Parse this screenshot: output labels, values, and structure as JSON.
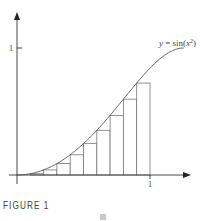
{
  "figure": {
    "caption": "FIGURE 1",
    "curve_label": "y = sin(x²)",
    "curve_label_parts": {
      "lhs": "y = sin(",
      "var": "x",
      "exp": "2",
      "close": ")"
    },
    "x_tick_label": "1",
    "y_tick_label": "1"
  },
  "colors": {
    "line": "#555555",
    "axis": "#333333",
    "rect": "#777777",
    "text": "#444444"
  },
  "chart_data": {
    "type": "area",
    "title": "",
    "function": "y = sin(x^2)",
    "xlabel": "",
    "ylabel": "",
    "xlim": [
      0,
      1.3
    ],
    "ylim": [
      0,
      1.15
    ],
    "x_ticks": [
      1
    ],
    "y_ticks": [
      1
    ],
    "grid": false,
    "rectangles": {
      "method": "left-endpoint (lower sum)",
      "n": 10,
      "interval": [
        0,
        1
      ],
      "x_left": [
        0.0,
        0.1,
        0.2,
        0.3,
        0.4,
        0.5,
        0.6,
        0.7,
        0.8,
        0.9
      ],
      "heights": [
        0.0,
        0.01,
        0.04,
        0.09,
        0.159,
        0.247,
        0.352,
        0.468,
        0.597,
        0.724
      ]
    },
    "curve_domain": [
      0,
      1.2533
    ]
  }
}
